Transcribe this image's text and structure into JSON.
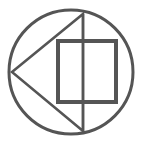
{
  "diagram": {
    "background": "#ffffff",
    "stroke_color": "#555555",
    "circle": {
      "cx": 71,
      "cy": 72,
      "r": 62,
      "stroke_width": 3
    },
    "triangle": {
      "points": "12,72 83,14 83,131",
      "stroke_width": 2.5
    },
    "vertical_line": {
      "x1": 83,
      "y1": 14,
      "x2": 83,
      "y2": 131,
      "stroke_width": 2.5
    },
    "rectangle": {
      "x": 58,
      "y": 41,
      "width": 58,
      "height": 61,
      "stroke_width": 4
    }
  }
}
